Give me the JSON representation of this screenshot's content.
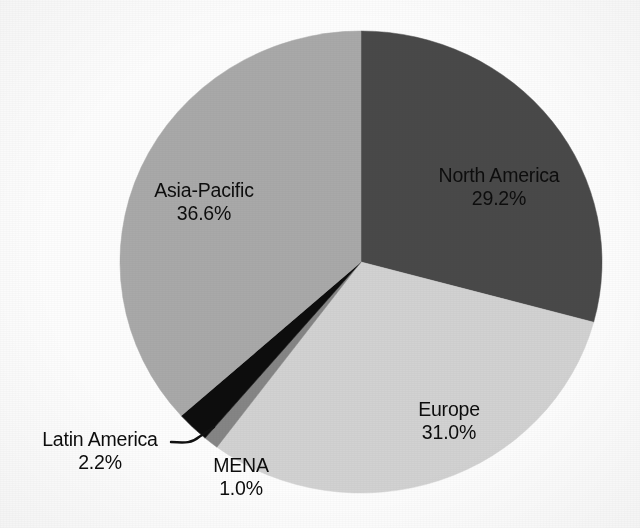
{
  "chart_data": {
    "type": "pie",
    "title": "",
    "subtitle": "",
    "xlabel": "",
    "ylabel": "",
    "legend": "none",
    "grid": false,
    "units": "percent",
    "start_angle_deg": 0,
    "direction": "clockwise",
    "categories": [
      "North America",
      "Europe",
      "MENA",
      "Latin America",
      "Asia-Pacific"
    ],
    "values": [
      29.2,
      31.0,
      1.0,
      2.2,
      36.6
    ],
    "total": 100.0,
    "slices": [
      {
        "name": "North America",
        "value": 29.2,
        "value_label": "29.2%",
        "color": "#4a4a4a",
        "label_position": "inside",
        "leader_line": false
      },
      {
        "name": "Europe",
        "value": 31.0,
        "value_label": "31.0%",
        "color": "#d2d2d2",
        "label_position": "inside",
        "leader_line": false
      },
      {
        "name": "MENA",
        "value": 1.0,
        "value_label": "1.0%",
        "color": "#858585",
        "label_position": "outside",
        "leader_line": false
      },
      {
        "name": "Latin America",
        "value": 2.2,
        "value_label": "2.2%",
        "color": "#0a0a0a",
        "label_position": "outside",
        "leader_line": true
      },
      {
        "name": "Asia-Pacific",
        "value": 36.6,
        "value_label": "36.6%",
        "color": "#a9a9a9",
        "label_position": "inside",
        "leader_line": false
      }
    ]
  },
  "labels": {
    "north_america": {
      "name": "North America",
      "pct": "29.2%"
    },
    "europe": {
      "name": "Europe",
      "pct": "31.0%"
    },
    "asia_pacific": {
      "name": "Asia-Pacific",
      "pct": "36.6%"
    },
    "latin_america": {
      "name": "Latin America",
      "pct": "2.2%"
    },
    "mena": {
      "name": "MENA",
      "pct": "1.0%"
    }
  },
  "colors": {
    "north_america": "#4a4a4a",
    "europe": "#d2d2d2",
    "mena": "#858585",
    "latin_america": "#0a0a0a",
    "asia_pacific": "#a9a9a9",
    "background": "#fdfdfd",
    "text": "#0d0d0d",
    "leader_line": "#111111"
  }
}
